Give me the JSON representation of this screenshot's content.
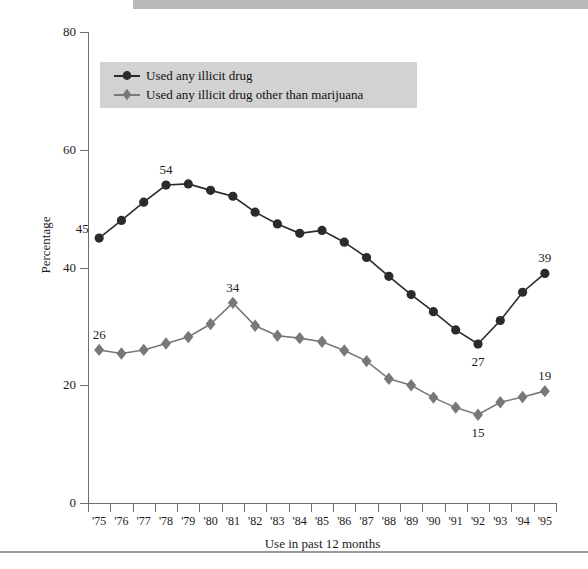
{
  "chart_data": {
    "type": "line",
    "title": "",
    "xlabel": "Use in past 12 months",
    "ylabel": "Percentage",
    "ylim": [
      0,
      80
    ],
    "yticks": [
      0,
      20,
      40,
      60,
      80
    ],
    "grid": false,
    "legend_position": "upper-left-inside",
    "categories": [
      "'75",
      "'76",
      "'77",
      "'78",
      "'79",
      "'80",
      "'81",
      "'82",
      "'83",
      "'84",
      "'85",
      "'86",
      "'87",
      "'88",
      "'89",
      "'90",
      "'91",
      "'92",
      "'93",
      "'94",
      "'95"
    ],
    "series": [
      {
        "name": "Used any illicit drug",
        "marker": "circle",
        "color": "#2b2b2b",
        "values": [
          45,
          48,
          51.1,
          54,
          54.2,
          53.1,
          52.1,
          49.4,
          47.4,
          45.8,
          46.3,
          44.3,
          41.7,
          38.5,
          35.4,
          32.5,
          29.4,
          27,
          31.0,
          35.8,
          39
        ]
      },
      {
        "name": "Used any illicit drug other than marijuana",
        "marker": "diamond",
        "color": "#787878",
        "values": [
          26,
          25.4,
          26.0,
          27.1,
          28.2,
          30.4,
          34,
          30.1,
          28.4,
          28.0,
          27.4,
          25.9,
          24.1,
          21.1,
          20.0,
          17.9,
          16.2,
          15,
          17.1,
          18.0,
          19
        ]
      }
    ],
    "point_labels": [
      {
        "series": 0,
        "index": 0,
        "text": "45",
        "pos": "left"
      },
      {
        "series": 0,
        "index": 3,
        "text": "54",
        "pos": "above"
      },
      {
        "series": 0,
        "index": 17,
        "text": "27",
        "pos": "below"
      },
      {
        "series": 0,
        "index": 20,
        "text": "39",
        "pos": "above"
      },
      {
        "series": 1,
        "index": 0,
        "text": "26",
        "pos": "above"
      },
      {
        "series": 1,
        "index": 6,
        "text": "34",
        "pos": "above"
      },
      {
        "series": 1,
        "index": 17,
        "text": "15",
        "pos": "below"
      },
      {
        "series": 1,
        "index": 20,
        "text": "19",
        "pos": "above"
      }
    ]
  },
  "legend": {
    "entries": [
      {
        "label": "Used any illicit drug"
      },
      {
        "label": "Used any illicit drug other than marijuana"
      }
    ]
  },
  "axes": {
    "ylabel": "Percentage",
    "xlabel": "Use in past 12 months",
    "ytick_labels": [
      "0",
      "20",
      "40",
      "60",
      "80"
    ],
    "xtick_labels": [
      "'75",
      "'76",
      "'77",
      "'78",
      "'79",
      "'80",
      "'81",
      "'82",
      "'83",
      "'84",
      "'85",
      "'86",
      "'87",
      "'88",
      "'89",
      "'90",
      "'91",
      "'92",
      "'93",
      "'94",
      "'95"
    ]
  },
  "colors": {
    "band": "#b9b9b9",
    "legend_bg": "#d2d2d2",
    "series_1": "#2b2b2b",
    "series_2": "#787878",
    "axis": "#6e6e6e"
  }
}
